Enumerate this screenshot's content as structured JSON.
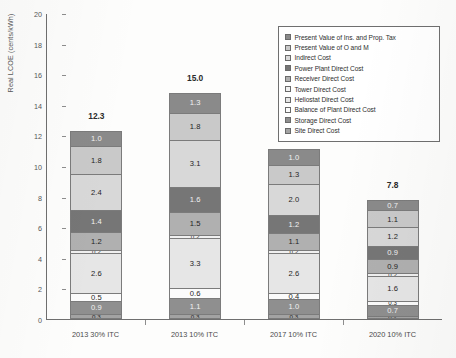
{
  "chart_data": {
    "type": "bar",
    "subtype": "stacked-bar",
    "title": "",
    "xlabel": "",
    "ylabel": "Real LCOE (cents/kWh)",
    "ylim": [
      0,
      20
    ],
    "ytick_step": 2,
    "yticks": [
      "0",
      "2",
      "4",
      "6",
      "8",
      "10",
      "12",
      "14",
      "16",
      "18",
      "20"
    ],
    "grid": false,
    "legend_position": "top-right",
    "categories": [
      "2013 30% ITC",
      "2013 10% ITC",
      "2017 10% ITC",
      "2020 10% ITC"
    ],
    "totals": [
      "12.3",
      "15.0",
      "11.1",
      "7.8"
    ],
    "series": [
      {
        "name": "Present Value of Ins. and Prop. Tax",
        "color": "#8a8a8a",
        "values": [
          1.0,
          1.3,
          1.0,
          0.7
        ],
        "labels": [
          "1.0",
          "1.3",
          "1.0",
          "0.7"
        ]
      },
      {
        "name": "Present Value of O and M",
        "color": "#c9c9c9",
        "values": [
          1.8,
          1.8,
          1.3,
          1.1
        ],
        "labels": [
          "1.8",
          "1.8",
          "1.3",
          "1.1"
        ]
      },
      {
        "name": "Indirect Cost",
        "color": "#d8d8d8",
        "values": [
          2.4,
          3.1,
          2.0,
          1.2
        ],
        "labels": [
          "2.4",
          "3.1",
          "2.0",
          "1.2"
        ]
      },
      {
        "name": "Power Plant Direct Cost",
        "color": "#767676",
        "values": [
          1.4,
          1.6,
          1.2,
          0.9
        ],
        "labels": [
          "1.4",
          "1.6",
          "1.2",
          "0.9"
        ]
      },
      {
        "name": "Receiver Direct Cost",
        "color": "#b0b0b0",
        "values": [
          1.2,
          1.5,
          1.1,
          0.9
        ],
        "labels": [
          "1.2",
          "1.5",
          "1.1",
          "0.9"
        ]
      },
      {
        "name": "Tower Direct Cost",
        "color": "#f0f0f0",
        "values": [
          0.2,
          0.2,
          0.2,
          0.2
        ],
        "labels": [
          "0.2",
          "0.2",
          "0.2",
          "0.2"
        ]
      },
      {
        "name": "Heliostat Direct Cost",
        "color": "#e6e6e6",
        "values": [
          2.6,
          3.3,
          2.6,
          1.6
        ],
        "labels": [
          "2.6",
          "3.3",
          "2.6",
          "1.6"
        ]
      },
      {
        "name": "Balance of Plant Direct Cost",
        "color": "#fbfbfb",
        "values": [
          0.5,
          0.6,
          0.4,
          0.3
        ],
        "labels": [
          "0.5",
          "0.6",
          "0.4",
          "0.3"
        ]
      },
      {
        "name": "Storage Direct Cost",
        "color": "#8f8f8f",
        "values": [
          0.9,
          1.1,
          1.0,
          0.7
        ],
        "labels": [
          "0.9",
          "1.1",
          "1.0",
          "0.7"
        ]
      },
      {
        "name": "Site Direct Cost",
        "color": "#a3a3a3",
        "values": [
          0.3,
          0.3,
          0.3,
          0.2
        ],
        "labels": [
          "0.3",
          "0.3",
          "0.3",
          "0.2"
        ]
      }
    ]
  }
}
